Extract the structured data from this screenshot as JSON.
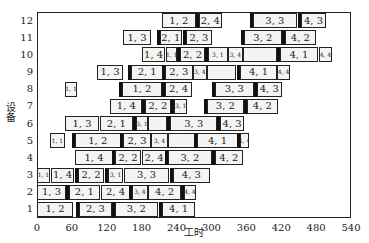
{
  "chart_data": {
    "type": "gantt",
    "title": "",
    "xlabel": "工时",
    "ylabel": "设备",
    "xlim": [
      0,
      540
    ],
    "x_ticks": [
      0,
      60,
      120,
      180,
      240,
      300,
      360,
      420,
      480,
      540
    ],
    "y_ticks": [
      1,
      2,
      3,
      4,
      5,
      6,
      7,
      8,
      9,
      10,
      11,
      12
    ],
    "grid": false,
    "legend": null,
    "rows": [
      {
        "machine": 1,
        "tasks": [
          {
            "label": "1, 2",
            "start": 0,
            "end": 62
          },
          {
            "label": "2, 3",
            "start": 72,
            "end": 129
          },
          {
            "label": "3, 2",
            "start": 134,
            "end": 208
          },
          {
            "label": "4, 1",
            "start": 215,
            "end": 272
          }
        ]
      },
      {
        "machine": 2,
        "tasks": [
          {
            "label": "1, 3",
            "start": 0,
            "end": 50
          },
          {
            "label": "2, 1",
            "start": 55,
            "end": 108
          },
          {
            "label": "2, 4",
            "start": 110,
            "end": 160
          },
          {
            "label": "3, 4",
            "start": 163,
            "end": 191
          },
          {
            "label": "4, 2",
            "start": 191,
            "end": 248
          },
          {
            "label": "4, 4",
            "start": 253,
            "end": 273
          }
        ]
      },
      {
        "machine": 3,
        "tasks": [
          {
            "label": "1, 1",
            "start": 0,
            "end": 22
          },
          {
            "label": "1, 4",
            "start": 24,
            "end": 64
          },
          {
            "label": "2, 2",
            "start": 71,
            "end": 115
          },
          {
            "label": "3, 1",
            "start": 122,
            "end": 148
          },
          {
            "label": "3, 3",
            "start": 150,
            "end": 227
          },
          {
            "label": "4, 3",
            "start": 234,
            "end": 297
          }
        ]
      },
      {
        "machine": 4,
        "tasks": [
          {
            "label": "1, 4",
            "start": 65,
            "end": 131
          },
          {
            "label": "2, 2",
            "start": 134,
            "end": 179
          },
          {
            "label": "2, 4",
            "start": 181,
            "end": 222
          },
          {
            "label": "3, 2",
            "start": 225,
            "end": 301
          },
          {
            "label": "4, 2",
            "start": 306,
            "end": 354
          }
        ]
      },
      {
        "machine": 5,
        "tasks": [
          {
            "label": "1, 1",
            "start": 22,
            "end": 48
          },
          {
            "label": "1, 2",
            "start": 65,
            "end": 144
          },
          {
            "label": "2, 3",
            "start": 148,
            "end": 196
          },
          {
            "label": "3, 4",
            "start": 196,
            "end": 225
          },
          {
            "label": "",
            "start": 225,
            "end": 272
          },
          {
            "label": "4, 1",
            "start": 275,
            "end": 346
          },
          {
            "label": "4, 4",
            "start": 349,
            "end": 364
          }
        ]
      },
      {
        "machine": 6,
        "tasks": [
          {
            "label": "1, 3",
            "start": 48,
            "end": 107
          },
          {
            "label": "2, 1",
            "start": 108,
            "end": 165
          },
          {
            "label": "3, 1",
            "start": 170,
            "end": 191
          },
          {
            "label": "",
            "start": 191,
            "end": 223
          },
          {
            "label": "3, 3",
            "start": 229,
            "end": 310
          },
          {
            "label": "4, 3",
            "start": 315,
            "end": 356
          }
        ]
      },
      {
        "machine": 7,
        "tasks": [
          {
            "label": "1, 4",
            "start": 126,
            "end": 181
          },
          {
            "label": "2, 2",
            "start": 186,
            "end": 230
          },
          {
            "label": "3, 1",
            "start": 236,
            "end": 258
          },
          {
            "label": "3, 2",
            "start": 292,
            "end": 356
          },
          {
            "label": "4, 2",
            "start": 361,
            "end": 414
          }
        ]
      },
      {
        "machine": 8,
        "tasks": [
          {
            "label": "1, 1",
            "start": 48,
            "end": 69
          },
          {
            "label": "1, 2",
            "start": 146,
            "end": 215
          },
          {
            "label": "2, 4",
            "start": 220,
            "end": 267
          },
          {
            "label": "3, 3",
            "start": 306,
            "end": 373
          },
          {
            "label": "4, 3",
            "start": 378,
            "end": 421
          }
        ]
      },
      {
        "machine": 9,
        "tasks": [
          {
            "label": "1, 3",
            "start": 103,
            "end": 148
          },
          {
            "label": "2, 1",
            "start": 162,
            "end": 217
          },
          {
            "label": "2, 3",
            "start": 220,
            "end": 268
          },
          {
            "label": "3, 4",
            "start": 268,
            "end": 292
          },
          {
            "label": "",
            "start": 292,
            "end": 342
          },
          {
            "label": "4, 1",
            "start": 349,
            "end": 413
          },
          {
            "label": "4, 4",
            "start": 413,
            "end": 435
          }
        ]
      },
      {
        "machine": 10,
        "tasks": [
          {
            "label": "1, 4",
            "start": 181,
            "end": 220
          },
          {
            "label": "1, 1",
            "start": 222,
            "end": 241
          },
          {
            "label": "2, 2",
            "start": 246,
            "end": 289
          },
          {
            "label": "3, 1",
            "start": 294,
            "end": 328
          },
          {
            "label": "3, 4",
            "start": 328,
            "end": 354
          },
          {
            "label": "",
            "start": 354,
            "end": 413
          },
          {
            "label": "4, 1",
            "start": 418,
            "end": 483
          },
          {
            "label": "4, 4",
            "start": 485,
            "end": 507
          }
        ]
      },
      {
        "machine": 11,
        "tasks": [
          {
            "label": "1, 3",
            "start": 148,
            "end": 196
          },
          {
            "label": "2, 1",
            "start": 211,
            "end": 249
          },
          {
            "label": "2, 3",
            "start": 256,
            "end": 301
          },
          {
            "label": "3, 2",
            "start": 356,
            "end": 421
          },
          {
            "label": "4, 2",
            "start": 426,
            "end": 480
          }
        ]
      },
      {
        "machine": 12,
        "tasks": [
          {
            "label": "1, 2",
            "start": 215,
            "end": 273
          },
          {
            "label": "2, 4",
            "start": 278,
            "end": 318
          },
          {
            "label": "3, 3",
            "start": 371,
            "end": 447
          },
          {
            "label": "4, 3",
            "start": 454,
            "end": 497
          }
        ]
      }
    ]
  },
  "layout": {
    "plot_left": 37,
    "plot_right": 351,
    "plot_top": 12,
    "plot_bottom": 218
  }
}
